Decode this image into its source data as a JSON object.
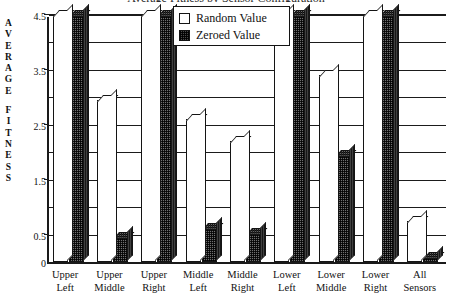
{
  "chart_data": {
    "type": "bar",
    "title": "Average Fitness by Sensor Configuration",
    "xlabel": "",
    "ylabel": "AVERAGE FITNESS",
    "ylim": [
      0,
      4.5
    ],
    "ytick_labels": [
      "0",
      "0.5",
      "1.5",
      "2.5",
      "3.5",
      "4.5"
    ],
    "ytick_values": [
      0,
      0.5,
      1.5,
      2.5,
      3.5,
      4.5
    ],
    "gridline_values": [
      0.5,
      1.0,
      1.5,
      2.0,
      2.5,
      3.0,
      3.5,
      4.0,
      4.5
    ],
    "grid": true,
    "legend_position": "top-center",
    "categories": [
      "Upper Left",
      "Upper Middle",
      "Upper Right",
      "Middle Left",
      "Middle Right",
      "Lower Left",
      "Lower Middle",
      "Lower Right",
      "All Sensors"
    ],
    "category_lines": [
      [
        "Upper",
        "Left"
      ],
      [
        "Upper",
        "Middle"
      ],
      [
        "Upper",
        "Right"
      ],
      [
        "Middle",
        "Left"
      ],
      [
        "Middle",
        "Right"
      ],
      [
        "Lower",
        "Left"
      ],
      [
        "Lower",
        "Middle"
      ],
      [
        "Lower",
        "Right"
      ],
      [
        "All",
        "Sensors"
      ]
    ],
    "series": [
      {
        "name": "Random Value",
        "color": "#ffffff",
        "values": [
          4.5,
          2.95,
          4.5,
          2.6,
          2.2,
          4.5,
          3.4,
          4.5,
          0.75
        ]
      },
      {
        "name": "Zeroed Value",
        "color": "#5a5a5a",
        "values": [
          4.5,
          0.45,
          4.5,
          0.62,
          0.52,
          4.5,
          1.95,
          4.5,
          0.1
        ]
      }
    ]
  },
  "legend": {
    "items": [
      {
        "label": "Random Value",
        "swatch": "random"
      },
      {
        "label": "Zeroed Value",
        "swatch": "zeroed"
      }
    ]
  },
  "axis": {
    "y_caption_letters": [
      "A",
      "V",
      "E",
      "R",
      "A",
      "G",
      "E",
      "F",
      "I",
      "T",
      "N",
      "E",
      "S",
      "S"
    ]
  }
}
